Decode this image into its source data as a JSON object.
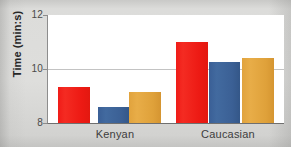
{
  "chart_data": {
    "type": "bar",
    "title": "",
    "subtitle": "",
    "xlabel": "",
    "ylabel": "Time (min:s)",
    "categories": [
      "Kenyan",
      "Caucasian"
    ],
    "ylim": [
      8,
      12
    ],
    "yticks": [
      8,
      10,
      12
    ],
    "ytick_labels": [
      "8",
      "10",
      "12"
    ],
    "grid": "horizontal-at-10",
    "legend": "none",
    "series": [
      {
        "name": "series-1",
        "color": "#ED1A14",
        "values": [
          9.35,
          11.0
        ]
      },
      {
        "name": "series-2",
        "color": "#3B6095",
        "values": [
          8.6,
          10.25
        ]
      },
      {
        "name": "series-3",
        "color": "#DFA13A",
        "values": [
          9.15,
          10.4
        ]
      }
    ],
    "bars": [
      {
        "group": "Kenyan",
        "series": "series-1",
        "value": 9.35,
        "color": "#ED1A14"
      },
      {
        "group": "Kenyan",
        "series": "series-2",
        "value": 8.6,
        "color": "#3B6095"
      },
      {
        "group": "Kenyan",
        "series": "series-3",
        "value": 9.15,
        "color": "#DFA13A"
      },
      {
        "group": "Caucasian",
        "series": "series-1",
        "value": 11.0,
        "color": "#ED1A14"
      },
      {
        "group": "Caucasian",
        "series": "series-2",
        "value": 10.25,
        "color": "#3B6095"
      },
      {
        "group": "Caucasian",
        "series": "series-3",
        "value": 10.4,
        "color": "#DFA13A"
      }
    ]
  },
  "axis": {
    "y_title": "Time (min:s)",
    "tick_12": "12",
    "tick_10": "10",
    "tick_8": "8"
  },
  "categories": {
    "kenyan": "Kenyan",
    "caucasian": "Caucasian"
  },
  "colors": {
    "red": "#ED1A14",
    "blue": "#3B6095",
    "orange": "#DFA13A",
    "gridline": "#C3C3C3",
    "axis": "#6F6F6F",
    "plot_background": "#FFFFFF",
    "page_background": "#D9D9D7"
  }
}
